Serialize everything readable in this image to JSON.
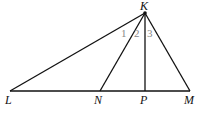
{
  "diagram": {
    "title": "",
    "points": {
      "K": {
        "label": "K",
        "x": 145,
        "y": 13
      },
      "L": {
        "label": "L",
        "x": 10,
        "y": 91
      },
      "N": {
        "label": "N",
        "x": 100,
        "y": 91
      },
      "P": {
        "label": "P",
        "x": 145,
        "y": 91
      },
      "M": {
        "label": "M",
        "x": 190,
        "y": 91
      }
    },
    "segments": [
      "KL",
      "KN",
      "KP",
      "KM",
      "LM"
    ],
    "angle_labels": [
      "1",
      "2",
      "3"
    ],
    "colors": {
      "line": "#111111",
      "angle_label": "#888888"
    }
  }
}
